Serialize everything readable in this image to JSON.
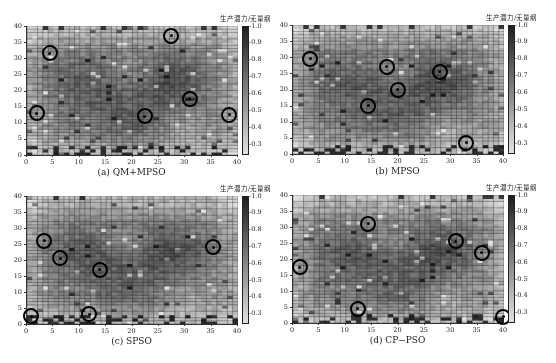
{
  "figure": {
    "colorbar_title": "生产潜力/无量纲",
    "colorbar_ticks": [
      "1.0",
      "0.9",
      "0.8",
      "0.7",
      "0.6",
      "0.5",
      "0.4",
      "0.3"
    ],
    "x_ticks": [
      "0",
      "5",
      "10",
      "15",
      "20",
      "25",
      "30",
      "35",
      "40"
    ],
    "y_ticks": [
      "40",
      "35",
      "30",
      "25",
      "20",
      "15",
      "10",
      "5",
      "0"
    ]
  },
  "panels": [
    {
      "id": "a",
      "caption": "(a) QM+MPSO"
    },
    {
      "id": "b",
      "caption": "(b) MPSO"
    },
    {
      "id": "c",
      "caption": "(c) SPSO"
    },
    {
      "id": "d",
      "caption": "(d) CP−PSO"
    }
  ],
  "chart_data": [
    {
      "type": "heatmap",
      "title": "(a) QM+MPSO",
      "xlabel": "",
      "ylabel": "",
      "xlim": [
        0,
        40
      ],
      "ylim": [
        0,
        40
      ],
      "colorbar": {
        "label": "生产潜力/无量纲",
        "range": [
          0.25,
          1.0
        ],
        "ticks": [
          0.3,
          0.4,
          0.5,
          0.6,
          0.7,
          0.8,
          0.9,
          1.0
        ]
      },
      "grid": "40x40 cells, dark=high potential",
      "well_locations": [
        [
          2,
          13
        ],
        [
          4.5,
          31.5
        ],
        [
          22.5,
          12
        ],
        [
          27.5,
          37
        ],
        [
          31,
          17.5
        ],
        [
          38.5,
          12.5
        ]
      ]
    },
    {
      "type": "heatmap",
      "title": "(b) MPSO",
      "xlim": [
        0,
        40
      ],
      "ylim": [
        0,
        40
      ],
      "colorbar": {
        "label": "生产潜力/无量纲",
        "range": [
          0.25,
          1.0
        ],
        "ticks": [
          0.3,
          0.4,
          0.5,
          0.6,
          0.7,
          0.8,
          0.9,
          1.0
        ]
      },
      "well_locations": [
        [
          3.5,
          29.5
        ],
        [
          14.5,
          15
        ],
        [
          18,
          27
        ],
        [
          20,
          20
        ],
        [
          28,
          25.5
        ],
        [
          33,
          3.5
        ]
      ]
    },
    {
      "type": "heatmap",
      "title": "(c) SPSO",
      "xlim": [
        0,
        40
      ],
      "ylim": [
        0,
        40
      ],
      "colorbar": {
        "label": "生产潜力/无量纲",
        "range": [
          0.25,
          1.0
        ],
        "ticks": [
          0.3,
          0.4,
          0.5,
          0.6,
          0.7,
          0.8,
          0.9,
          1.0
        ]
      },
      "well_locations": [
        [
          1,
          2.5
        ],
        [
          3.5,
          26
        ],
        [
          6.5,
          20.5
        ],
        [
          14,
          17
        ],
        [
          12,
          3
        ],
        [
          35.5,
          24
        ]
      ]
    },
    {
      "type": "heatmap",
      "title": "(d) CP−PSO",
      "xlim": [
        0,
        40
      ],
      "ylim": [
        0,
        40
      ],
      "colorbar": {
        "label": "生产潜力/无量纲",
        "range": [
          0.25,
          1.0
        ],
        "ticks": [
          0.3,
          0.4,
          0.5,
          0.6,
          0.7,
          0.8,
          0.9,
          1.0
        ]
      },
      "well_locations": [
        [
          1.5,
          17.5
        ],
        [
          14.5,
          31
        ],
        [
          12.5,
          4.5
        ],
        [
          31,
          25.5
        ],
        [
          36,
          22
        ],
        [
          40,
          2
        ]
      ]
    }
  ]
}
